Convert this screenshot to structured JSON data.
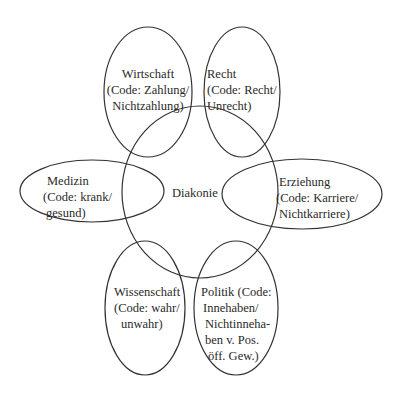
{
  "diagram": {
    "center": {
      "label": "Diakonie"
    },
    "systems": [
      {
        "id": "wirtschaft",
        "lines": [
          "Wirtschaft",
          "(Code: Zahlung/",
          "Nichtzahlung)"
        ]
      },
      {
        "id": "recht",
        "lines": [
          "Recht",
          "(Code: Recht/",
          "Unrecht)"
        ]
      },
      {
        "id": "medizin",
        "lines": [
          "Medizin",
          "(Code: krank/",
          "gesund)"
        ]
      },
      {
        "id": "erziehung",
        "lines": [
          "Erziehung",
          "(Code: Karriere/",
          "Nichtkarriere)"
        ]
      },
      {
        "id": "wissenschaft",
        "lines": [
          "Wissenschaft",
          "(Code: wahr/",
          "unwahr)"
        ]
      },
      {
        "id": "politik",
        "lines": [
          "Politik (Code:",
          "Innehaben/",
          "Nichtinneha-",
          "ben v. Pos.",
          "öff. Gew.)"
        ]
      }
    ],
    "stroke_color": "#333333"
  }
}
